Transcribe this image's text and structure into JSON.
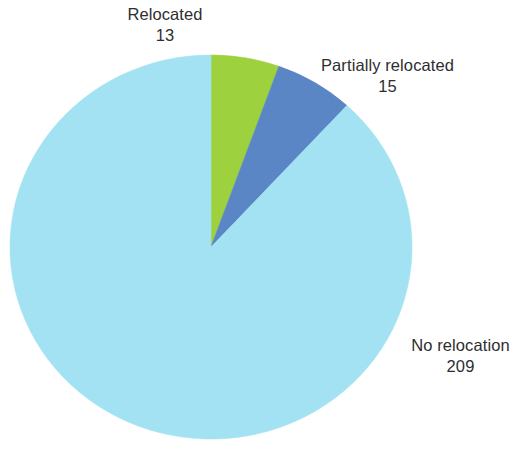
{
  "chart_data": {
    "type": "pie",
    "title": "",
    "subtitle": "",
    "xlabel": "",
    "ylabel": "",
    "total": 237,
    "legend_position": "none",
    "labels_position": "outside-callout-free",
    "grid": false,
    "start_angle_deg": 0,
    "direction": "clockwise",
    "background_color": "#ffffff",
    "label_text_color": "#2e2e30",
    "categories": [
      "Relocated",
      "Partially relocated",
      "No relocation"
    ],
    "values": [
      13,
      15,
      209
    ],
    "colors": [
      "#9ed13e",
      "#5b86c6",
      "#a3e2f2"
    ],
    "slices": [
      {
        "name": "Relocated",
        "value": 13,
        "value_text": "13",
        "color": "#9ed13e",
        "percent": 5.5,
        "start_angle_deg": 0,
        "sweep_angle_deg": 19.7
      },
      {
        "name": "Partially relocated",
        "value": 15,
        "value_text": "15",
        "color": "#5b86c6",
        "percent": 6.3,
        "start_angle_deg": 19.7,
        "sweep_angle_deg": 22.8
      },
      {
        "name": "No relocation",
        "value": 209,
        "value_text": "209",
        "color": "#a3e2f2",
        "percent": 88.2,
        "start_angle_deg": 42.5,
        "sweep_angle_deg": 317.5
      }
    ],
    "geometry": {
      "center_x": 211,
      "center_y": 247,
      "radius_x": 201,
      "radius_y": 192
    }
  }
}
